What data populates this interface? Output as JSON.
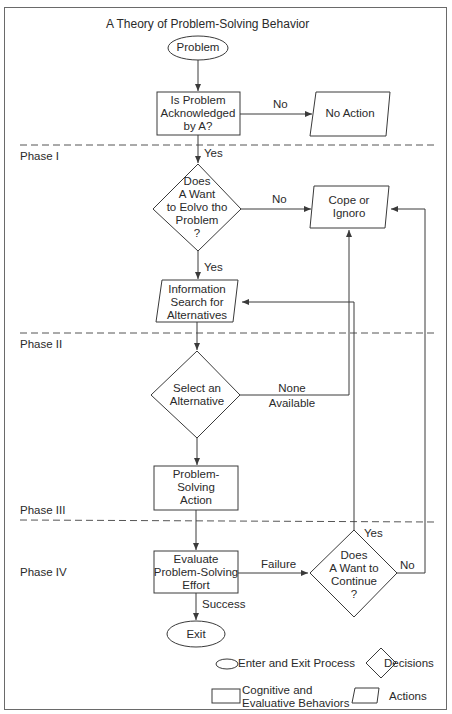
{
  "title": "A Theory of Problem-Solving Behavior",
  "phases": [
    "Phase I",
    "Phase II",
    "Phase III",
    "Phase IV"
  ],
  "nodes": {
    "problem": "Problem",
    "acknowledged": [
      "Is Problem",
      "Acknowledged",
      "by A?"
    ],
    "no_action": "No Action",
    "want_solve": [
      "Does",
      "A Want",
      "to Eolvo tho",
      "Problem",
      "?"
    ],
    "cope": [
      "Cope or",
      "Ignoro"
    ],
    "info_search": [
      "Information",
      "Search for",
      "Alternatives"
    ],
    "select": [
      "Select an",
      "Alternative"
    ],
    "ps_action": [
      "Problem-",
      "Solving",
      "Action"
    ],
    "evaluate": [
      "Evaluate",
      "Problem-Solving",
      "Effort"
    ],
    "continue": [
      "Does",
      "A Want to",
      "Continue",
      "?"
    ],
    "exit": "Exit"
  },
  "edges": {
    "no1": "No",
    "yes1": "Yes",
    "no2": "No",
    "yes2": "Yes",
    "none_available": [
      "None",
      "Available"
    ],
    "failure": "Failure",
    "success": "Success",
    "yes3": "Yes",
    "no3": "No"
  },
  "legend": {
    "ellipse": "Enter and Exit Process",
    "diamond": "Decisions",
    "rect": [
      "Cognitive and",
      "Evaluative Behaviors"
    ],
    "parallelogram": "Actions"
  },
  "colors": {
    "line": "#3a3a3a",
    "dash": "#555555",
    "frame": "#6a6a6a"
  }
}
